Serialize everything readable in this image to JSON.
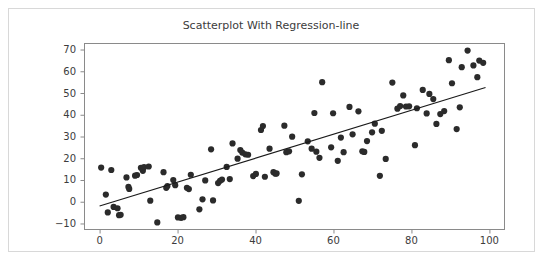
{
  "chart_data": {
    "type": "scatter",
    "title": "Scatterplot With Regression-line",
    "xlabel": "",
    "ylabel": "",
    "xlim": [
      -4,
      104
    ],
    "ylim": [
      -13,
      73
    ],
    "grid": false,
    "legend": null,
    "xticks": [
      0,
      20,
      40,
      60,
      80,
      100
    ],
    "yticks": [
      -10,
      0,
      10,
      20,
      30,
      40,
      50,
      60,
      70
    ],
    "xtick_labels": [
      "0",
      "20",
      "40",
      "60",
      "80",
      "100"
    ],
    "ytick_labels": [
      "−10",
      "0",
      "10",
      "20",
      "30",
      "40",
      "50",
      "60",
      "70"
    ],
    "marker": {
      "shape": "circle",
      "size": 4.0,
      "color": "#2b2b2b"
    },
    "regression": {
      "type": "line",
      "color": "#1a1a1a",
      "slope": 0.551,
      "intercept": -2.0,
      "x_start": 0,
      "y_start": -2.0,
      "x_end": 99,
      "y_end": 52.5
    },
    "points": [
      [
        0.4,
        15.7
      ],
      [
        1.6,
        3.3
      ],
      [
        2.1,
        -4.9
      ],
      [
        3.0,
        14.6
      ],
      [
        3.6,
        -2.4
      ],
      [
        4.6,
        -3.0
      ],
      [
        5.0,
        -6.2
      ],
      [
        5.4,
        -6.0
      ],
      [
        6.9,
        11.2
      ],
      [
        7.4,
        6.8
      ],
      [
        7.6,
        5.9
      ],
      [
        9.1,
        12.0
      ],
      [
        9.6,
        12.3
      ],
      [
        10.6,
        15.6
      ],
      [
        11.1,
        14.2
      ],
      [
        11.4,
        15.9
      ],
      [
        12.6,
        16.2
      ],
      [
        13.0,
        0.5
      ],
      [
        14.8,
        -9.5
      ],
      [
        16.4,
        13.6
      ],
      [
        17.1,
        6.4
      ],
      [
        17.4,
        7.2
      ],
      [
        18.9,
        10.0
      ],
      [
        19.4,
        7.6
      ],
      [
        20.1,
        -7.2
      ],
      [
        20.9,
        -7.4
      ],
      [
        21.5,
        -7.1
      ],
      [
        22.4,
        6.4
      ],
      [
        22.9,
        5.8
      ],
      [
        23.4,
        12.4
      ],
      [
        25.6,
        -3.5
      ],
      [
        26.4,
        1.1
      ],
      [
        27.1,
        9.8
      ],
      [
        28.6,
        24.1
      ],
      [
        29.1,
        0.6
      ],
      [
        30.4,
        8.6
      ],
      [
        30.9,
        9.6
      ],
      [
        31.4,
        10.2
      ],
      [
        32.6,
        16.0
      ],
      [
        33.4,
        10.4
      ],
      [
        34.1,
        26.8
      ],
      [
        35.4,
        19.8
      ],
      [
        36.1,
        23.8
      ],
      [
        36.6,
        22.6
      ],
      [
        37.4,
        21.8
      ],
      [
        38.1,
        21.6
      ],
      [
        39.4,
        11.8
      ],
      [
        40.1,
        12.8
      ],
      [
        41.4,
        33.0
      ],
      [
        41.9,
        34.8
      ],
      [
        42.4,
        11.5
      ],
      [
        43.6,
        24.4
      ],
      [
        44.6,
        13.6
      ],
      [
        45.1,
        12.9
      ],
      [
        45.4,
        13.0
      ],
      [
        47.4,
        35.0
      ],
      [
        47.9,
        22.8
      ],
      [
        48.6,
        23.2
      ],
      [
        49.4,
        29.9
      ],
      [
        51.1,
        0.4
      ],
      [
        51.9,
        12.6
      ],
      [
        53.4,
        27.8
      ],
      [
        54.4,
        24.4
      ],
      [
        55.1,
        40.8
      ],
      [
        55.6,
        23.0
      ],
      [
        56.4,
        20.2
      ],
      [
        57.1,
        55.0
      ],
      [
        59.4,
        25.0
      ],
      [
        59.9,
        40.7
      ],
      [
        61.1,
        18.8
      ],
      [
        61.9,
        29.5
      ],
      [
        62.6,
        22.8
      ],
      [
        64.1,
        43.6
      ],
      [
        64.9,
        31.0
      ],
      [
        66.4,
        41.6
      ],
      [
        67.4,
        23.2
      ],
      [
        67.9,
        22.9
      ],
      [
        68.6,
        27.9
      ],
      [
        69.9,
        31.9
      ],
      [
        70.6,
        35.9
      ],
      [
        71.9,
        11.9
      ],
      [
        72.4,
        32.6
      ],
      [
        73.4,
        19.7
      ],
      [
        75.1,
        54.8
      ],
      [
        76.4,
        42.8
      ],
      [
        77.1,
        44.0
      ],
      [
        77.9,
        48.9
      ],
      [
        78.6,
        43.8
      ],
      [
        79.4,
        43.9
      ],
      [
        80.9,
        26.0
      ],
      [
        81.4,
        43.0
      ],
      [
        82.9,
        51.4
      ],
      [
        83.9,
        40.6
      ],
      [
        84.6,
        49.6
      ],
      [
        85.6,
        47.2
      ],
      [
        86.4,
        35.8
      ],
      [
        87.4,
        40.3
      ],
      [
        88.4,
        41.7
      ],
      [
        89.6,
        65.1
      ],
      [
        90.4,
        54.5
      ],
      [
        91.6,
        33.4
      ],
      [
        92.4,
        43.4
      ],
      [
        92.9,
        61.9
      ],
      [
        94.4,
        69.5
      ],
      [
        95.9,
        62.7
      ],
      [
        96.9,
        57.3
      ],
      [
        97.4,
        64.9
      ],
      [
        98.4,
        63.9
      ]
    ]
  },
  "figure": {
    "axes_left_px": 84,
    "axes_right_px": 505,
    "axes_top_px": 43,
    "axes_bottom_px": 230
  }
}
